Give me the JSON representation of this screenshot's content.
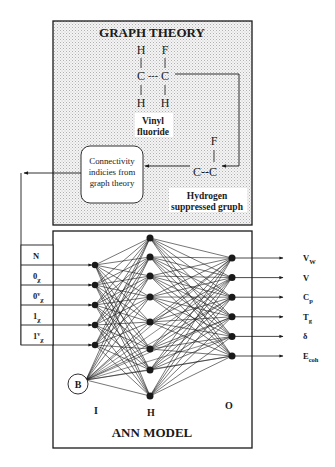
{
  "graph_theory": {
    "title": "GRAPH THEORY",
    "molecule": {
      "top_left": "H",
      "top_right": "F",
      "center_left": "C",
      "center_bond": "---",
      "center_right": "C",
      "bottom_left": "H",
      "bottom_right": "H",
      "name_line1": "Vinyl",
      "name_line2": "fluoride"
    },
    "suppressed": {
      "top": "F",
      "bond": "C--C",
      "label_line1": "Hydrogen",
      "label_line2": "suppressed gruph"
    },
    "connectivity_box": {
      "line1": "Connectivity",
      "line2": "indicies from",
      "line3": "graph theory"
    }
  },
  "ann_model": {
    "title": "ANN MODEL",
    "layer_labels": {
      "input": "I",
      "hidden": "H",
      "output": "O"
    },
    "bias_label": "B",
    "inputs": [
      {
        "main": "N",
        "sup": "",
        "sub": ""
      },
      {
        "main": "0",
        "sup": "",
        "sub": "χ"
      },
      {
        "main": "0",
        "sup": "v",
        "sub": "χ"
      },
      {
        "main": "1",
        "sup": "",
        "sub": "χ"
      },
      {
        "main": "1",
        "sup": "v",
        "sub": "χ"
      }
    ],
    "outputs": [
      {
        "main": "V",
        "sub": "W"
      },
      {
        "main": "V",
        "sub": ""
      },
      {
        "main": "C",
        "sub": "p"
      },
      {
        "main": "T",
        "sub": "g"
      },
      {
        "main": "δ",
        "sub": ""
      },
      {
        "main": "E",
        "sub": "coh"
      }
    ],
    "hidden_node_count": 8
  },
  "colors": {
    "stroke": "#1a1a1a",
    "panel_fill": "#ececec",
    "background": "#ffffff"
  }
}
